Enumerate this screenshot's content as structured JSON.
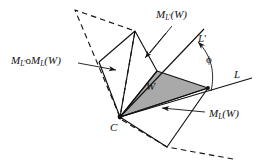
{
  "figure": {
    "background_color": "#ffffff",
    "stroke_color": "#121212",
    "shaded_fill": "#a9a9a9",
    "labels": {
      "reflected_once_upper": {
        "base": "M",
        "sub": "L",
        "sub_prime": "'",
        "arg": "(W)",
        "text": "M_L'(W)"
      },
      "composition": {
        "base": "M",
        "sub": "L",
        "sub_prime": "'",
        "op": "o",
        "base2": "M",
        "sub2": "L",
        "arg": "(W)",
        "text": "M_L'oM_L(W)"
      },
      "line_l_prime": {
        "base": "L",
        "prime": "'",
        "text": "L'"
      },
      "line_l": {
        "base": "L",
        "text": "L"
      },
      "reflected_once_lower": {
        "base": "M",
        "sub": "L",
        "arg": "(W)",
        "text": "M_L(W)"
      },
      "wedge": {
        "text": "W"
      },
      "center": {
        "text": "C"
      },
      "angle": {
        "text": "ϕ"
      }
    }
  },
  "geometry": {
    "apex": {
      "x": 120,
      "y": 117
    },
    "wedge_points": "120,117 157,71 208,88",
    "lines": {
      "L": {
        "x1": 120,
        "y1": 117,
        "x2": 252,
        "y2": 78
      },
      "L_prime": {
        "x1": 120,
        "y1": 117,
        "x2": 203,
        "y2": 30
      }
    },
    "angle_arc": {
      "radius": 72,
      "from_label": "L'",
      "to_label": "L"
    }
  }
}
